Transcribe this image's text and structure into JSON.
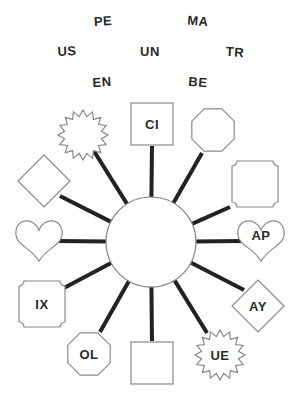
{
  "word_bank": [
    {
      "id": "pe",
      "text": "PE"
    },
    {
      "id": "ma",
      "text": "MA"
    },
    {
      "id": "us",
      "text": "US"
    },
    {
      "id": "un",
      "text": "UN"
    },
    {
      "id": "tr",
      "text": "TR"
    },
    {
      "id": "en",
      "text": "EN"
    },
    {
      "id": "be",
      "text": "BE"
    }
  ],
  "hub": {
    "shape": "circle",
    "label": ""
  },
  "nodes": [
    {
      "id": "n1",
      "shape": "starburst",
      "label": ""
    },
    {
      "id": "n2",
      "shape": "square",
      "label": "CI"
    },
    {
      "id": "n3",
      "shape": "octagon",
      "label": ""
    },
    {
      "id": "n4",
      "shape": "notched-square",
      "label": ""
    },
    {
      "id": "n5",
      "shape": "diamond",
      "label": ""
    },
    {
      "id": "n6",
      "shape": "heart",
      "label": ""
    },
    {
      "id": "n7",
      "shape": "heart",
      "label": "AP"
    },
    {
      "id": "n8",
      "shape": "notched-square",
      "label": "IX"
    },
    {
      "id": "n9",
      "shape": "diamond",
      "label": "AY"
    },
    {
      "id": "n10",
      "shape": "octagon",
      "label": "OL"
    },
    {
      "id": "n11",
      "shape": "square",
      "label": ""
    },
    {
      "id": "n12",
      "shape": "starburst",
      "label": "UE"
    }
  ]
}
